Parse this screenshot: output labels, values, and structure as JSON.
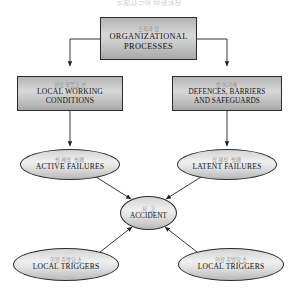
{
  "figure": {
    "title_clipped": "조직사고의 발생과정",
    "accent": "#2b2b2b",
    "korean_label_color": "#8e8e8e",
    "english_label_color": "#111111"
  },
  "nodes": {
    "organizational_processes": {
      "kr": "조직과정",
      "en_line1": "ORGANIZATIONAL",
      "en_line2": "PROCESSES",
      "shape": "rectangle"
    },
    "local_working_conditions": {
      "kr": "현장작업조건",
      "en_line1": "LOCAL  WORKING",
      "en_line2": "CONDITIONS",
      "shape": "rectangle"
    },
    "defences_barriers_safeguards": {
      "kr": "방어기제",
      "en_line1": "DEFENCES, BARRIERS",
      "en_line2": "AND SAFEGUARDS",
      "shape": "rectangle"
    },
    "active_failures": {
      "kr": "실제적 실패",
      "en_line1": "ACTIVE  FAILURES",
      "shape": "ellipse"
    },
    "latent_failures": {
      "kr": "잠재적 실패",
      "en_line1": "LATENT  FAILURES",
      "shape": "ellipse"
    },
    "accident": {
      "kr": "사 고",
      "en_line1": "ACCIDENT",
      "shape": "ellipse"
    },
    "local_triggers_left": {
      "kr": "현장촉발요소",
      "en_line1": "LOCAL  TRIGGERS",
      "shape": "ellipse"
    },
    "local_triggers_right": {
      "kr": "현장촉발요소",
      "en_line1": "LOCAL  TRIGGERS",
      "shape": "ellipse"
    }
  },
  "edges": [
    {
      "from": "organizational_processes",
      "to": "local_working_conditions",
      "style": "elbow-arrow"
    },
    {
      "from": "organizational_processes",
      "to": "defences_barriers_safeguards",
      "style": "elbow-arrow"
    },
    {
      "from": "local_working_conditions",
      "to": "active_failures",
      "style": "straight-arrow"
    },
    {
      "from": "defences_barriers_safeguards",
      "to": "latent_failures",
      "style": "straight-arrow"
    },
    {
      "from": "active_failures",
      "to": "accident",
      "style": "diagonal-arrow"
    },
    {
      "from": "latent_failures",
      "to": "accident",
      "style": "diagonal-arrow"
    },
    {
      "from": "local_triggers_left",
      "to": "accident",
      "style": "diagonal-arrow"
    },
    {
      "from": "local_triggers_right",
      "to": "accident",
      "style": "diagonal-arrow"
    }
  ]
}
